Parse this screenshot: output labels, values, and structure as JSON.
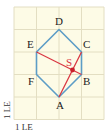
{
  "figure": {
    "type": "geometry-grid-diagram",
    "grid": {
      "columns": 4,
      "rows": 5,
      "background": "#fdfbe6",
      "line_color": "#e3dec2"
    },
    "unit_labels": {
      "x": "1 LE",
      "y": "1 LE"
    },
    "hexagon": {
      "color": "#5c9dc6",
      "vertices": [
        {
          "name": "A",
          "x": 2,
          "y": 1
        },
        {
          "name": "B",
          "x": 3,
          "y": 2
        },
        {
          "name": "C",
          "x": 3,
          "y": 3
        },
        {
          "name": "D",
          "x": 2,
          "y": 4
        },
        {
          "name": "E",
          "x": 1,
          "y": 3
        },
        {
          "name": "F",
          "x": 1,
          "y": 2
        }
      ]
    },
    "diagonals": {
      "color": "#d9343f",
      "segments": [
        {
          "from": "E",
          "to": "B"
        },
        {
          "from": "A",
          "to": "C"
        }
      ]
    },
    "intersection": {
      "label": "S",
      "color": "#d9343f"
    },
    "labels": {
      "A": "A",
      "B": "B",
      "C": "C",
      "D": "D",
      "E": "E",
      "F": "F",
      "S": "S"
    }
  }
}
